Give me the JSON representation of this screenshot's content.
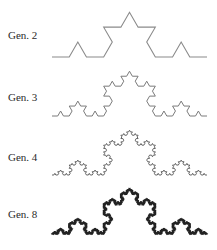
{
  "figure": {
    "rows": [
      {
        "label": "Gen. 2",
        "generation": 2,
        "label_top": 29,
        "x0": 52,
        "x1": 207,
        "baseline": 57,
        "stroke": "#8a8a8a",
        "stroke_width": 1.1
      },
      {
        "label": "Gen. 3",
        "generation": 3,
        "label_top": 91,
        "x0": 52,
        "x1": 207,
        "baseline": 116,
        "stroke": "#7a7a7a",
        "stroke_width": 1.0
      },
      {
        "label": "Gen. 4",
        "generation": 4,
        "label_top": 151,
        "x0": 52,
        "x1": 207,
        "baseline": 175,
        "stroke": "#555555",
        "stroke_width": 0.9
      },
      {
        "label": "Gen. 8",
        "generation": 8,
        "label_top": 208,
        "x0": 52,
        "x1": 207,
        "baseline": 234,
        "stroke": "#222222",
        "stroke_width": 1.3
      }
    ]
  }
}
